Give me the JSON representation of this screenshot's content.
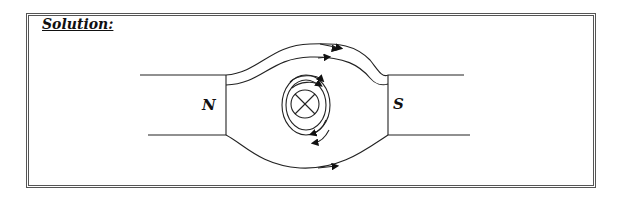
{
  "title": "Solution:",
  "diagram": {
    "labels": {
      "north": "N",
      "south": "S"
    },
    "conductor_symbol": "current-into-page (⊗)",
    "field_line_color": "#222222",
    "border_color": "#555555"
  }
}
